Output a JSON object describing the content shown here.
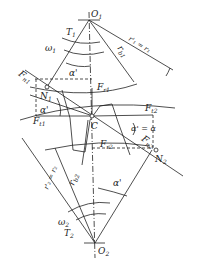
{
  "diagram": {
    "title": "",
    "type": "gear meshing force diagram",
    "labels": {
      "O1": "O",
      "O1_sub": "1",
      "T1": "T",
      "T1_sub": "1",
      "w1": "ω",
      "w1_sub": "1",
      "alpha_top": "α'",
      "r1": "r'₁ = r₁",
      "rb1": "r",
      "rb1_sub": "b1",
      "Fn1": "F",
      "Fn1_sub": "n1",
      "N1": "N",
      "N1_sub": "1",
      "Fr1": "F",
      "Fr1_sub": "r1",
      "alpha_left": "α'",
      "Ft1": "F",
      "Ft1_sub": "t1",
      "C": "C",
      "Ft2": "F",
      "Ft2_sub": "t2",
      "alpha_eq": "α' = α",
      "Fn2": "F",
      "Fn2_sub": "n2",
      "Fr2": "F",
      "Fr2_sub": "r2",
      "N2": "N",
      "N2_sub": "2",
      "r2": "r'₂ = r₂",
      "rb2": "r",
      "rb2_sub": "b2",
      "alpha_bottom": "α'",
      "w2": "ω",
      "w2_sub": "2",
      "T2": "T",
      "T2_sub": "2",
      "O2": "O",
      "O2_sub": "2"
    }
  }
}
